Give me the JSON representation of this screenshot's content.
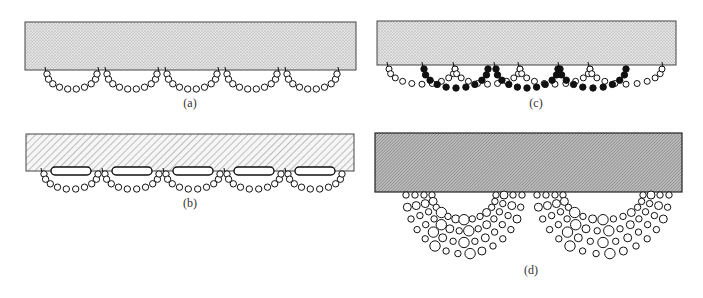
{
  "figure": {
    "panels": [
      {
        "id": "a",
        "label": "(a)",
        "surface": {
          "x": 25,
          "y": 22,
          "w": 331,
          "h": 48,
          "fill": "dots"
        },
        "loops": 5,
        "bead_style": "open"
      },
      {
        "id": "b",
        "label": "(b)",
        "surface": {
          "x": 26,
          "y": 134,
          "w": 328,
          "h": 37,
          "fill": "hatch"
        },
        "loops": 5,
        "bead_style": "open",
        "trains": 5
      },
      {
        "id": "c",
        "label": "(c)",
        "surface": {
          "x": 377,
          "y": 21,
          "w": 299,
          "h": 44,
          "fill": "dots"
        },
        "loops_open": 5,
        "loops_filled": 4,
        "bead_style": "open+filled"
      },
      {
        "id": "d",
        "label": "(d)",
        "surface": {
          "x": 375,
          "y": 133,
          "w": 307,
          "h": 59,
          "fill": "dense-hatch"
        },
        "loop_groups": 2,
        "loops_per_group": 4,
        "bead_style": "open-varied"
      }
    ]
  }
}
